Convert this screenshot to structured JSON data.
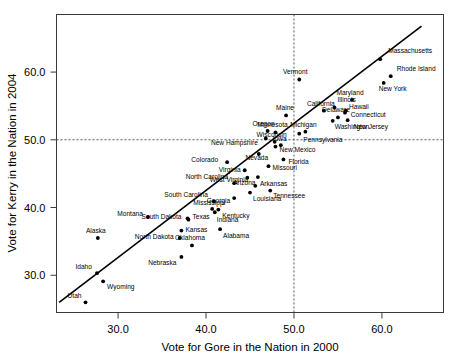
{
  "chart_data": {
    "type": "scatter",
    "title": "",
    "xlabel": "Vote for Gore in the Nation in 2000",
    "ylabel": "Vote for Kerry in the Nation in 2004",
    "xlim": [
      23.0,
      67.0
    ],
    "ylim": [
      24.5,
      68.5
    ],
    "xticks": [
      30.0,
      40.0,
      50.0,
      60.0
    ],
    "yticks": [
      30.0,
      40.0,
      50.0,
      60.0
    ],
    "xtick_labels": [
      "30.0",
      "40.0",
      "50.0",
      "60.0"
    ],
    "ytick_labels": [
      "30.0",
      "40.0",
      "50.0",
      "60.0"
    ],
    "grid": false,
    "reference_lines": [
      {
        "name": "vertical-50-reference",
        "orientation": "vertical",
        "value": 50.0,
        "style": "dashed"
      },
      {
        "name": "horizontal-50-reference",
        "orientation": "horizontal",
        "value": 50.0,
        "style": "dashed"
      }
    ],
    "fit_line": {
      "name": "regression-line",
      "x0": 23.3,
      "y0": 26.0,
      "x1": 64.5,
      "y1": 66.8
    },
    "legend": null,
    "points": [
      {
        "label": "Massachusetts",
        "x": 59.8,
        "y": 61.9,
        "lx": 8,
        "ly": -6,
        "anchor": "start"
      },
      {
        "label": "Rhode Island",
        "x": 61.0,
        "y": 59.4,
        "lx": 6,
        "ly": -5,
        "anchor": "start"
      },
      {
        "label": "New York",
        "x": 60.2,
        "y": 58.4,
        "lx": -5,
        "ly": 8,
        "anchor": "start"
      },
      {
        "label": "Vermont",
        "x": 50.6,
        "y": 58.9,
        "lx": -4,
        "ly": -6,
        "anchor": "middle"
      },
      {
        "label": "Maryland",
        "x": 56.6,
        "y": 55.9,
        "lx": -2,
        "ly": -5,
        "anchor": "middle"
      },
      {
        "label": "Hawaii",
        "x": 55.8,
        "y": 54.0,
        "lx": 4,
        "ly": -4,
        "anchor": "start"
      },
      {
        "label": "Illinois",
        "x": 54.6,
        "y": 54.8,
        "lx": 3,
        "ly": -5,
        "anchor": "start"
      },
      {
        "label": "Connecticut",
        "x": 55.9,
        "y": 54.3,
        "lx": 5,
        "ly": 6,
        "anchor": "start"
      },
      {
        "label": "New Jersey",
        "x": 56.1,
        "y": 52.9,
        "lx": 6,
        "ly": 9,
        "anchor": "start"
      },
      {
        "label": "Delaware",
        "x": 55.0,
        "y": 53.3,
        "lx": -2,
        "ly": -5,
        "anchor": "middle"
      },
      {
        "label": "Washington",
        "x": 54.4,
        "y": 52.8,
        "lx": 2,
        "ly": 8,
        "anchor": "start"
      },
      {
        "label": "California",
        "x": 53.4,
        "y": 54.3,
        "lx": -3,
        "ly": -5,
        "anchor": "middle"
      },
      {
        "label": "Michigan",
        "x": 51.3,
        "y": 51.2,
        "lx": -2,
        "ly": -5,
        "anchor": "middle"
      },
      {
        "label": "Maine",
        "x": 49.1,
        "y": 53.6,
        "lx": -1,
        "ly": -5,
        "anchor": "middle"
      },
      {
        "label": "Minnesota",
        "x": 47.9,
        "y": 51.1,
        "lx": -3,
        "ly": -5,
        "anchor": "middle"
      },
      {
        "label": "Oregon",
        "x": 47.0,
        "y": 51.3,
        "lx": -4,
        "ly": -5,
        "anchor": "middle"
      },
      {
        "label": "Wisconsin",
        "x": 47.8,
        "y": 49.7,
        "lx": -3,
        "ly": -5,
        "anchor": "middle"
      },
      {
        "label": "Iowa",
        "x": 48.5,
        "y": 49.2,
        "lx": -1,
        "ly": -4,
        "anchor": "middle"
      },
      {
        "label": "Pennsylvania",
        "x": 50.6,
        "y": 50.9,
        "lx": 4,
        "ly": 8,
        "anchor": "start"
      },
      {
        "label": "New Hampshire",
        "x": 46.8,
        "y": 50.2,
        "lx": -8,
        "ly": 7,
        "anchor": "end"
      },
      {
        "label": "New Mexico",
        "x": 47.9,
        "y": 49.0,
        "lx": 4,
        "ly": 5,
        "anchor": "start"
      },
      {
        "label": "Nevada",
        "x": 46.0,
        "y": 47.9,
        "lx": -2,
        "ly": 6,
        "anchor": "middle"
      },
      {
        "label": "Colorado",
        "x": 42.4,
        "y": 46.7,
        "lx": -9,
        "ly": 0,
        "anchor": "end"
      },
      {
        "label": "Missouri",
        "x": 47.1,
        "y": 46.1,
        "lx": 4,
        "ly": 4,
        "anchor": "start"
      },
      {
        "label": "Florida",
        "x": 48.8,
        "y": 47.1,
        "lx": 5,
        "ly": 5,
        "anchor": "start"
      },
      {
        "label": "Virginia",
        "x": 44.4,
        "y": 45.5,
        "lx": -4,
        "ly": 2,
        "anchor": "end"
      },
      {
        "label": "Arizona",
        "x": 44.7,
        "y": 44.4,
        "lx": -3,
        "ly": 7,
        "anchor": "middle"
      },
      {
        "label": "Arkansas",
        "x": 45.9,
        "y": 44.5,
        "lx": 2,
        "ly": 9,
        "anchor": "start"
      },
      {
        "label": "Tennessee",
        "x": 47.3,
        "y": 42.5,
        "lx": 3,
        "ly": 7,
        "anchor": "start"
      },
      {
        "label": "West Virginia",
        "x": 45.6,
        "y": 43.2,
        "lx": -7,
        "ly": -4,
        "anchor": "end"
      },
      {
        "label": "Louisiana",
        "x": 45.0,
        "y": 42.2,
        "lx": 3,
        "ly": 8,
        "anchor": "start"
      },
      {
        "label": "Georgia",
        "x": 43.2,
        "y": 41.4,
        "lx": -4,
        "ly": 5,
        "anchor": "end"
      },
      {
        "label": "North Carolina",
        "x": 43.2,
        "y": 43.6,
        "lx": -6,
        "ly": -4,
        "anchor": "end"
      },
      {
        "label": "South Carolina",
        "x": 40.9,
        "y": 40.9,
        "lx": -6,
        "ly": -4,
        "anchor": "end"
      },
      {
        "label": "Mississippi",
        "x": 40.7,
        "y": 39.8,
        "lx": -3,
        "ly": -4,
        "anchor": "middle"
      },
      {
        "label": "Kentucky",
        "x": 41.4,
        "y": 39.7,
        "lx": 4,
        "ly": 8,
        "anchor": "start"
      },
      {
        "label": "Texas",
        "x": 38.0,
        "y": 38.2,
        "lx": 4,
        "ly": -1,
        "anchor": "start"
      },
      {
        "label": "Indiana",
        "x": 41.0,
        "y": 39.3,
        "lx": 2,
        "ly": 10,
        "anchor": "start"
      },
      {
        "label": "Alabama",
        "x": 41.6,
        "y": 36.8,
        "lx": 3,
        "ly": 9,
        "anchor": "start"
      },
      {
        "label": "Oklahoma",
        "x": 38.4,
        "y": 34.4,
        "lx": -2,
        "ly": -5,
        "anchor": "middle"
      },
      {
        "label": "Kansas",
        "x": 37.2,
        "y": 36.6,
        "lx": 4,
        "ly": 1,
        "anchor": "start"
      },
      {
        "label": "South Dakota",
        "x": 37.9,
        "y": 38.4,
        "lx": -6,
        "ly": 1,
        "anchor": "end"
      },
      {
        "label": "North Dakota",
        "x": 37.0,
        "y": 35.5,
        "lx": -6,
        "ly": 1,
        "anchor": "end"
      },
      {
        "label": "Montana",
        "x": 33.4,
        "y": 38.6,
        "lx": -5,
        "ly": -1,
        "anchor": "end"
      },
      {
        "label": "Nebraska",
        "x": 37.2,
        "y": 32.7,
        "lx": -5,
        "ly": 8,
        "anchor": "end"
      },
      {
        "label": "Alaska",
        "x": 27.7,
        "y": 35.5,
        "lx": -2,
        "ly": -5,
        "anchor": "middle"
      },
      {
        "label": "Idaho",
        "x": 27.6,
        "y": 30.3,
        "lx": -5,
        "ly": -4,
        "anchor": "end"
      },
      {
        "label": "Wyoming",
        "x": 28.3,
        "y": 29.1,
        "lx": 4,
        "ly": 8,
        "anchor": "start"
      },
      {
        "label": "Utah",
        "x": 26.3,
        "y": 26.0,
        "lx": -4,
        "ly": -4,
        "anchor": "end"
      }
    ]
  },
  "colors": {
    "point": "#000000",
    "fit_line": "#000000",
    "reference_line": "#555555",
    "frame": "#3a3a3a",
    "background": "#ffffff"
  }
}
